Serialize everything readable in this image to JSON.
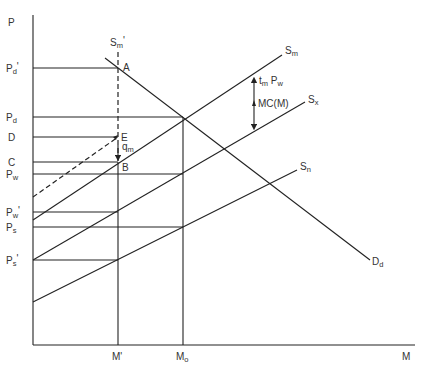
{
  "axes": {
    "y_label": "P",
    "x_label": "M",
    "origin": [
      33,
      345
    ],
    "y_top": 15,
    "x_right": 415
  },
  "price_levels": [
    {
      "id": "pd-prime",
      "main": "P",
      "sub": "d",
      "prime": "'",
      "y": 68,
      "x_end": 118
    },
    {
      "id": "pd",
      "main": "P",
      "sub": "d",
      "prime": "",
      "y": 117,
      "x_end": 183
    },
    {
      "id": "d",
      "main": "D",
      "sub": "",
      "prime": "",
      "y": 137,
      "x_end": 118
    },
    {
      "id": "c",
      "main": "C",
      "sub": "",
      "prime": "",
      "y": 162,
      "x_end": 118
    },
    {
      "id": "pw",
      "main": "P",
      "sub": "w",
      "prime": "",
      "y": 174,
      "x_end": 183
    },
    {
      "id": "pw-prime",
      "main": "P",
      "sub": "w",
      "prime": "'",
      "y": 212,
      "x_end": 118
    },
    {
      "id": "ps",
      "main": "P",
      "sub": "s",
      "prime": "",
      "y": 227,
      "x_end": 183
    },
    {
      "id": "ps-prime",
      "main": "P",
      "sub": "s",
      "prime": "'",
      "y": 260,
      "x_end": 118
    }
  ],
  "quantity_levels": [
    {
      "id": "m-prime",
      "main": "M",
      "sub": "",
      "prime": "'",
      "x": 118,
      "y_top": 52
    },
    {
      "id": "m-o",
      "main": "M",
      "sub": "o",
      "prime": "",
      "x": 183,
      "y_top": 117
    }
  ],
  "curves": [
    {
      "id": "sm",
      "main": "S",
      "sub": "m",
      "x1": 33,
      "y1": 220,
      "x2": 282,
      "y2": 55,
      "style": "solid"
    },
    {
      "id": "sx",
      "main": "S",
      "sub": "x",
      "x1": 33,
      "y1": 260,
      "x2": 305,
      "y2": 102,
      "style": "solid"
    },
    {
      "id": "sn",
      "main": "S",
      "sub": "n",
      "x1": 33,
      "y1": 302,
      "x2": 297,
      "y2": 170,
      "style": "solid"
    },
    {
      "id": "dd",
      "main": "D",
      "sub": "d",
      "x1": 105,
      "y1": 58,
      "x2": 370,
      "y2": 260,
      "style": "solid"
    },
    {
      "id": "sm-shifted",
      "main": "",
      "sub": "",
      "x1": 33,
      "y1": 197,
      "x2": 118,
      "y2": 137,
      "style": "dashed"
    }
  ],
  "quota_line": {
    "main": "S",
    "sub": "m",
    "prime": "'",
    "x": 118,
    "y1": 52,
    "y2": 162
  },
  "points": [
    {
      "id": "a",
      "label": "A",
      "x": 118,
      "y": 68
    },
    {
      "id": "e",
      "label": "E",
      "x": 118,
      "y": 137
    },
    {
      "id": "b",
      "label": "B",
      "x": 118,
      "y": 162
    }
  ],
  "annotations": {
    "qm": {
      "main": "q",
      "sub": "m"
    },
    "tariff": {
      "main1": "t",
      "sub1": "m",
      "main2": " P",
      "sub2": "w"
    },
    "mc": "MC(M)"
  }
}
